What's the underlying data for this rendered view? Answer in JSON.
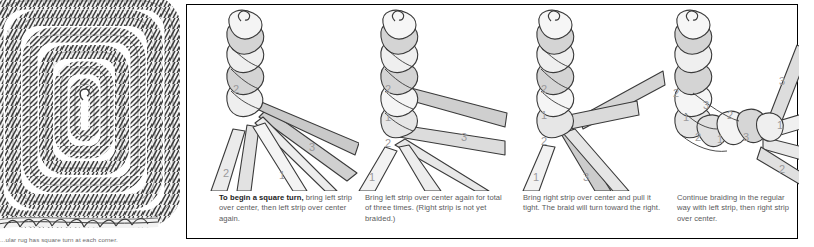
{
  "figure": {
    "rug": {
      "name": "braided-rug-illustration",
      "caption": "...ular rug has square turn at each corner.",
      "description": "Concentric rectangular braided rug with rounded corners, shown in gray chevron braid texture",
      "rings": 6
    }
  },
  "panel": {
    "border_color": "#000000",
    "background": "#ffffff",
    "steps": [
      {
        "id": "step-1",
        "lead": "To begin a square turn,",
        "text": " bring left strip over center, then left strip over center again.",
        "full_text": "To begin a square turn, bring left strip over center, then left strip over center again.",
        "strand_labels": [
          "2",
          "3",
          "2",
          "1"
        ]
      },
      {
        "id": "step-2",
        "lead": "",
        "text": "Bring left strip over center again for total of three times. (Right strip is not yet braided.)",
        "full_text": "Bring left strip over center again for total of three times. (Right strip is not yet braided.)",
        "strand_labels": [
          "2",
          "1",
          "2",
          "3",
          "1"
        ]
      },
      {
        "id": "step-3",
        "lead": "",
        "text": "Bring right strip over center and pull it tight. The braid will turn toward the right.",
        "full_text": "Bring right strip over center and pull it tight. The braid will turn toward the right.",
        "strand_labels": [
          "2",
          "1",
          "2",
          "1",
          "3"
        ]
      },
      {
        "id": "step-4",
        "lead": "",
        "text": "Continue braiding in the regular way with left strip, then right strip over center.",
        "full_text": "Continue braiding in the regular way with left strip, then right strip over center.",
        "strand_labels": [
          "2",
          "3",
          "1",
          "2",
          "1",
          "3",
          "3",
          "1",
          "2"
        ]
      }
    ]
  },
  "colors": {
    "strand_light": "#f0f0f0",
    "strand_mid": "#d8d8d8",
    "strand_dark": "#b9b9b9",
    "outline": "#3a3a3a",
    "label": "#9a9a9c",
    "text": "#5a5a5c",
    "heading": "#1b1b1b"
  }
}
